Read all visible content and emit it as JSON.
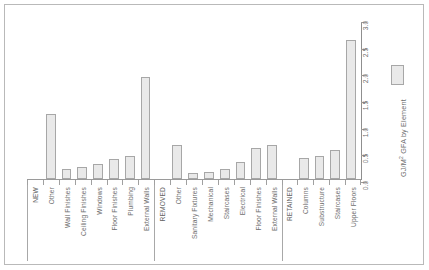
{
  "chart_data": {
    "type": "bar",
    "title": "",
    "xlabel": "",
    "ylabel": "GJ/M² GFA by Element",
    "ylim": [
      0.0,
      3.0
    ],
    "ytick_labels": [
      "0.0",
      "0.5",
      "1.0",
      "1.5",
      "2.0",
      "2.5",
      "3.0"
    ],
    "ytick_values": [
      0.0,
      0.5,
      1.0,
      1.5,
      2.0,
      2.5,
      3.0
    ],
    "grid": false,
    "legend_position": "right",
    "legend_entries": [
      "GJ/M² GFA by Element"
    ],
    "series_name": "GJ/M² GFA by Element",
    "groups": [
      "NEW",
      "REMOVED",
      "RETAINED"
    ],
    "categories": [
      "NEW",
      "Other",
      "Wall Finishes",
      "Ceiling Finishes",
      "Windows",
      "Floor Finishes",
      "Plumbing",
      "External Walls",
      "REMOVED",
      "Other",
      "Sanitary Fixtures",
      "Mechanical",
      "Staircases",
      "Electrical",
      "Floor Finishes",
      "External Walls",
      "RETAINED",
      "Columns",
      "Substructure",
      "Staircases",
      "Upper Floors"
    ],
    "is_group_header": [
      true,
      false,
      false,
      false,
      false,
      false,
      false,
      false,
      true,
      false,
      false,
      false,
      false,
      false,
      false,
      false,
      true,
      false,
      false,
      false,
      false
    ],
    "values": [
      null,
      1.22,
      0.19,
      0.23,
      0.29,
      0.38,
      0.43,
      1.92,
      null,
      0.63,
      0.12,
      0.13,
      0.19,
      0.32,
      0.59,
      0.63,
      null,
      0.39,
      0.44,
      0.55,
      2.61
    ]
  },
  "legend": {
    "swatch_name": "series-swatch",
    "label_main": "GJ/M",
    "label_sup": "2",
    "label_rest": " GFA by Element"
  },
  "colors": {
    "bar_fill": "#e9e9e9",
    "bar_stroke": "#a7a7a7",
    "axis": "#9a9a9a",
    "text": "#6e6e6e",
    "frame": "#b9b9b9",
    "background": "#ffffff"
  }
}
